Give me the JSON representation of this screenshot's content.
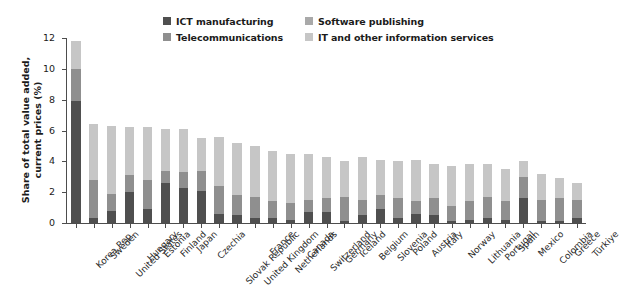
{
  "chart_data": {
    "type": "bar",
    "subtype": "stacked-bar",
    "title": "",
    "xlabel": "",
    "ylabel": "Share of total value added, current prices (%)",
    "ylim": [
      0,
      12
    ],
    "yticks": [
      0,
      2,
      4,
      6,
      8,
      10,
      12
    ],
    "grid": false,
    "legend_position": "top",
    "colors": {
      "ict_manufacturing": "#4f4f4f",
      "software_publishing": "#a9a9a9",
      "telecommunications": "#8f8f8f",
      "it_other_information_services": "#c6c6c6",
      "axis": "#4d4d4d",
      "text": "#1b1b1b"
    },
    "categories": [
      "Korea Rep.",
      "Sweden",
      "United States",
      "Hungary",
      "Estonia",
      "Finland",
      "Japan",
      "Czechia",
      "Slovak Republic",
      "United Kingdom",
      "France",
      "Netherlands",
      "Canada",
      "Switzerland",
      "Germany",
      "Iceland",
      "Belgium",
      "Slovenia",
      "Poland",
      "Austria",
      "Italy",
      "Norway",
      "Lithuania",
      "Portugal",
      "Spain",
      "Mexico",
      "Colombia",
      "Greece",
      "Türkiye"
    ],
    "series": [
      {
        "name": "ICT manufacturing",
        "key": "ict_manufacturing",
        "color": "#4f4f4f",
        "values": [
          7.9,
          0.3,
          0.8,
          2.0,
          0.9,
          2.6,
          2.3,
          2.1,
          0.6,
          0.5,
          0.3,
          0.3,
          0.2,
          0.7,
          0.7,
          0.1,
          0.5,
          0.9,
          0.3,
          0.6,
          0.5,
          0.1,
          0.2,
          0.3,
          0.2,
          1.6,
          0.1,
          0.1,
          0.3
        ]
      },
      {
        "name": "Telecommunications",
        "key": "telecommunications",
        "color": "#8f8f8f",
        "values": [
          2.1,
          2.5,
          1.1,
          1.1,
          1.9,
          0.8,
          1.0,
          1.3,
          1.8,
          1.3,
          1.4,
          1.1,
          1.1,
          0.8,
          0.9,
          1.6,
          1.0,
          0.9,
          1.3,
          0.8,
          1.1,
          1.0,
          1.2,
          1.4,
          1.2,
          1.4,
          1.4,
          1.5,
          1.2
        ]
      },
      {
        "name": "Software publishing",
        "key": "software_publishing",
        "color": "#a9a9a9",
        "values": [
          0.0,
          0.0,
          0.0,
          0.0,
          0.0,
          0.0,
          0.0,
          0.0,
          0.0,
          0.0,
          0.0,
          0.0,
          0.0,
          0.0,
          0.0,
          0.0,
          0.0,
          0.0,
          0.0,
          0.0,
          0.0,
          0.0,
          0.0,
          0.0,
          0.0,
          0.0,
          0.0,
          0.0,
          0.0
        ]
      },
      {
        "name": "IT and other information services",
        "key": "it_other_information_services",
        "color": "#c6c6c6",
        "values": [
          1.8,
          3.6,
          4.4,
          3.1,
          3.4,
          2.7,
          2.8,
          2.1,
          3.2,
          3.4,
          3.3,
          3.3,
          3.2,
          3.0,
          2.7,
          2.3,
          2.8,
          2.3,
          2.4,
          2.7,
          2.2,
          2.6,
          2.4,
          2.1,
          2.1,
          1.0,
          1.7,
          1.3,
          1.1
        ]
      }
    ],
    "totals": [
      11.8,
      6.4,
      6.3,
      6.2,
      6.2,
      6.1,
      6.1,
      5.5,
      5.6,
      5.2,
      5.0,
      4.7,
      4.5,
      4.5,
      4.3,
      4.0,
      4.3,
      4.1,
      4.0,
      4.1,
      3.8,
      3.7,
      3.8,
      3.8,
      3.5,
      4.0,
      3.2,
      2.9,
      2.6
    ]
  },
  "legend": {
    "items": [
      {
        "label": "ICT manufacturing",
        "color": "#4f4f4f"
      },
      {
        "label": "Software publishing",
        "color": "#a9a9a9"
      },
      {
        "label": "Telecommunications",
        "color": "#8f8f8f"
      },
      {
        "label": "IT and other information services",
        "color": "#c6c6c6"
      }
    ]
  },
  "axis": {
    "y_title_line1": "Share of total value added,",
    "y_title_line2": "current prices (%)"
  }
}
